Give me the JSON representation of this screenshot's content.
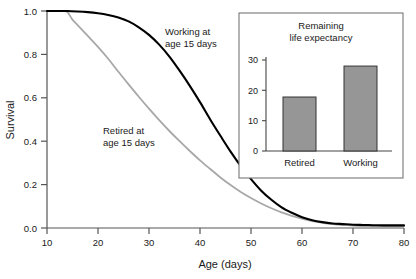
{
  "chart_data": [
    {
      "type": "line",
      "title": "",
      "xlabel": "Age (days)",
      "ylabel": "Survival",
      "xlim": [
        10,
        80
      ],
      "ylim": [
        0.0,
        1.0
      ],
      "xticks": [
        10,
        20,
        30,
        40,
        50,
        60,
        70,
        80
      ],
      "xtick_labels": [
        "10",
        "20",
        "30",
        "40",
        "50",
        "60",
        "70",
        "80"
      ],
      "yticks": [
        0.0,
        0.2,
        0.4,
        0.6,
        0.8,
        1.0
      ],
      "ytick_labels": [
        "0.0",
        "0.2",
        "0.4",
        "0.6",
        "0.8",
        "1.0"
      ],
      "grid": false,
      "legend": "inline-annotations",
      "series": [
        {
          "name": "Working at age 15 days",
          "color": "#000000",
          "annotation": "Working at\nage 15 days",
          "annotation_line1": "Working at",
          "annotation_line2": "age 15 days",
          "x": [
            10,
            12,
            14,
            16,
            18,
            20,
            22,
            24,
            26,
            28,
            30,
            32,
            34,
            36,
            38,
            40,
            42,
            44,
            46,
            48,
            50,
            52,
            54,
            56,
            58,
            60,
            62,
            64,
            66,
            68,
            70,
            72,
            74,
            76,
            78,
            80
          ],
          "y": [
            1.0,
            1.0,
            1.0,
            0.998,
            0.995,
            0.99,
            0.982,
            0.97,
            0.952,
            0.925,
            0.89,
            0.845,
            0.79,
            0.725,
            0.655,
            0.58,
            0.5,
            0.425,
            0.352,
            0.285,
            0.225,
            0.172,
            0.13,
            0.095,
            0.07,
            0.05,
            0.036,
            0.027,
            0.021,
            0.018,
            0.015,
            0.014,
            0.013,
            0.012,
            0.012,
            0.012
          ]
        },
        {
          "name": "Retired at age 15 days",
          "color": "#a8a8a8",
          "annotation": "Retired at\nage 15 days",
          "annotation_line1": "Retired at",
          "annotation_line2": "age 15 days",
          "x": [
            10,
            12,
            13,
            14,
            15,
            16,
            18,
            20,
            22,
            24,
            26,
            28,
            30,
            32,
            34,
            36,
            38,
            40,
            42,
            44,
            46,
            48,
            50,
            52,
            54,
            56,
            58,
            60,
            62,
            64,
            66,
            68,
            70,
            72,
            74,
            76,
            78,
            80
          ],
          "y": [
            1.0,
            1.0,
            1.0,
            0.995,
            0.96,
            0.935,
            0.885,
            0.835,
            0.78,
            0.72,
            0.662,
            0.605,
            0.55,
            0.497,
            0.447,
            0.4,
            0.355,
            0.312,
            0.272,
            0.233,
            0.198,
            0.166,
            0.138,
            0.113,
            0.091,
            0.072,
            0.056,
            0.043,
            0.032,
            0.024,
            0.018,
            0.014,
            0.011,
            0.009,
            0.008,
            0.008,
            0.008,
            0.008
          ]
        }
      ]
    },
    {
      "type": "bar",
      "title": "Remaining life expectancy",
      "title_line1": "Remaining",
      "title_line2": "life expectancy",
      "xlabel": "",
      "ylabel": "",
      "ylim": [
        0,
        30
      ],
      "yticks": [
        0,
        10,
        20,
        30
      ],
      "ytick_labels": [
        "0",
        "10",
        "20",
        "30"
      ],
      "categories": [
        "Retired",
        "Working"
      ],
      "values": [
        17.8,
        28.0
      ],
      "bar_color": "#969696",
      "bar_edge_color": "#333333",
      "grid": false,
      "legend": "none"
    }
  ],
  "figure": {
    "background": "#ffffff",
    "axis_color": "#555555"
  }
}
